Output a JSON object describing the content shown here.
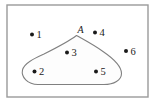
{
  "figure": {
    "kind": "set-membership-venn-diagram",
    "background_color": "#ffffff"
  },
  "universe_rect": {
    "name": "universal-set-rectangle",
    "x": 7,
    "y": 5,
    "width": 141,
    "height": 92,
    "stroke_color": "#9a9a9a",
    "fill_color": "#ffffff",
    "stroke_width": 1.4
  },
  "set_blob": {
    "label": "A",
    "label_x": 80.5,
    "label_y": 33,
    "stroke_color": "#808080",
    "fill_color": "#fdfdfd",
    "stroke_width": 1.1,
    "path": "M 76.5 35.5 C 70 40.5 56 48 44 54 C 33 59 24 63.5 22.5 70 C 21 77 27.5 84.5 38 84.5 C 52 84.5 90 84.5 104 84.5 C 114 84.5 121.5 80 121.5 73.5 C 121.5 67.5 114 59 103 51.5 C 91.5 43.5 81.5 38.5 76.5 35.5 Z"
  },
  "points": [
    {
      "id": "point-1",
      "label": "1",
      "cx": 32.0,
      "cy": 34.5,
      "label_x": 36.5,
      "label_y": 38.0,
      "inside_set": false
    },
    {
      "id": "point-2",
      "label": "2",
      "cx": 34.5,
      "cy": 71.5,
      "label_x": 39.0,
      "label_y": 75.0,
      "inside_set": true
    },
    {
      "id": "point-3",
      "label": "3",
      "cx": 67.0,
      "cy": 52.5,
      "label_x": 71.5,
      "label_y": 56.0,
      "inside_set": true
    },
    {
      "id": "point-4",
      "label": "4",
      "cx": 95.0,
      "cy": 32.5,
      "label_x": 99.5,
      "label_y": 36.0,
      "inside_set": false
    },
    {
      "id": "point-5",
      "label": "5",
      "cx": 96.0,
      "cy": 71.5,
      "label_x": 100.5,
      "label_y": 75.0,
      "inside_set": true
    },
    {
      "id": "point-6",
      "label": "6",
      "cx": 126.0,
      "cy": 51.0,
      "label_x": 130.5,
      "label_y": 54.5,
      "inside_set": false
    }
  ],
  "point_style": {
    "radius": 2.0,
    "dot_color": "#1a1a1a",
    "label_color": "#1a1a1a"
  }
}
